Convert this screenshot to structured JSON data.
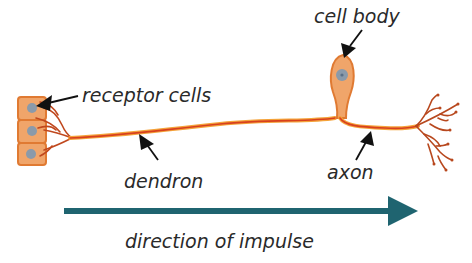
{
  "diagram": {
    "labels": {
      "receptor_cells": "receptor cells",
      "cell_body": "cell body",
      "dendron": "dendron",
      "axon": "axon",
      "direction": "direction of impulse"
    },
    "colors": {
      "nerve_fibre": "#e0662a",
      "nerve_fibre_highlight": "#f4a33a",
      "branch": "#b8481e",
      "cell_fill": "#f0a56a",
      "cell_stroke": "#e07a32",
      "nucleus": "#7c8fa0",
      "arrow_direction": "#1f6470",
      "pointer": "#111111",
      "text": "#2a2a2a"
    }
  }
}
